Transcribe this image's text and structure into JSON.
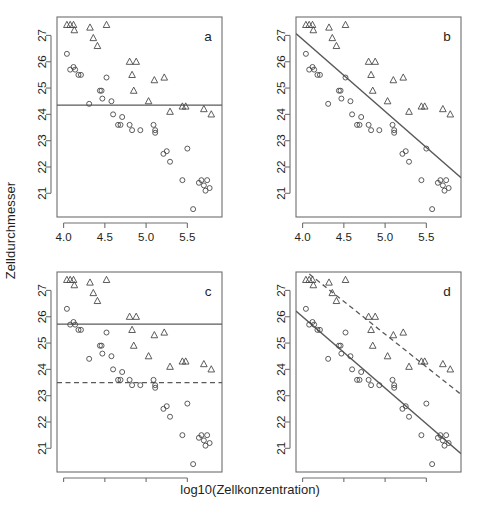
{
  "figure": {
    "xlabel": "log10(Zellkonzentration)",
    "ylabel": "Zelldurchmesser",
    "panel_labels": [
      "a",
      "b",
      "c",
      "d"
    ],
    "colors": {
      "axis": "#6e6e6e",
      "point": "#4a4a4a",
      "line": "#5a5a5a",
      "text": "#231f20",
      "background": "#ffffff"
    }
  },
  "chart_data": [
    {
      "type": "scatter",
      "panel": "a",
      "title": "a",
      "xlabel": "log10(Zellkonzentration)",
      "ylabel": "Zelldurchmesser",
      "xlim": [
        3.92,
        5.92
      ],
      "ylim": [
        20.1,
        27.7
      ],
      "xticks": [
        4.0,
        4.5,
        5.0,
        5.5
      ],
      "yticks": [
        21,
        22,
        23,
        24,
        25,
        26,
        27
      ],
      "grid": false,
      "legend": "none",
      "series": [
        {
          "name": "circles",
          "marker": "circle",
          "x": [
            4.04,
            4.08,
            4.12,
            4.14,
            4.18,
            4.21,
            4.31,
            4.44,
            4.46,
            4.47,
            4.52,
            4.58,
            4.6,
            4.66,
            4.69,
            4.71,
            4.8,
            4.83,
            4.93,
            5.09,
            5.11,
            5.11,
            5.21,
            5.25,
            5.29,
            5.44,
            5.5,
            5.57,
            5.64,
            5.67,
            5.7,
            5.72,
            5.74,
            5.77
          ],
          "y": [
            26.3,
            25.7,
            25.8,
            25.7,
            25.5,
            25.5,
            24.4,
            24.9,
            24.9,
            24.6,
            25.4,
            24.5,
            24.0,
            23.6,
            23.6,
            23.9,
            23.6,
            23.4,
            23.4,
            23.6,
            23.4,
            23.3,
            22.5,
            22.6,
            22.2,
            21.5,
            22.7,
            20.4,
            21.4,
            21.5,
            21.3,
            21.1,
            21.5,
            21.2
          ]
        },
        {
          "name": "triangles",
          "marker": "triangle",
          "x": [
            4.04,
            4.08,
            4.12,
            4.13,
            4.32,
            4.36,
            4.41,
            4.52,
            4.8,
            4.83,
            4.88,
            4.85,
            5.03,
            5.1,
            5.22,
            5.29,
            5.44,
            5.48,
            5.7,
            5.79
          ],
          "y": [
            27.4,
            27.4,
            27.4,
            27.2,
            27.3,
            26.9,
            26.6,
            27.4,
            26.0,
            25.5,
            26.0,
            24.9,
            24.5,
            25.3,
            25.4,
            24.1,
            24.3,
            24.3,
            24.2,
            24.0
          ]
        }
      ],
      "fitted_lines": [
        {
          "name": "common-mean",
          "style": "solid",
          "type": "horizontal",
          "intercept": 24.35,
          "slope": 0.0
        }
      ]
    },
    {
      "type": "scatter",
      "panel": "b",
      "title": "b",
      "xlabel": "log10(Zellkonzentration)",
      "ylabel": "Zelldurchmesser",
      "xlim": [
        3.92,
        5.92
      ],
      "ylim": [
        20.1,
        27.7
      ],
      "xticks": [
        4.0,
        4.5,
        5.0,
        5.5
      ],
      "yticks": [
        21,
        22,
        23,
        24,
        25,
        26,
        27
      ],
      "grid": false,
      "legend": "none",
      "series": [
        {
          "name": "circles",
          "marker": "circle",
          "x": [
            4.04,
            4.08,
            4.12,
            4.14,
            4.18,
            4.21,
            4.31,
            4.44,
            4.46,
            4.47,
            4.52,
            4.58,
            4.6,
            4.66,
            4.69,
            4.71,
            4.8,
            4.83,
            4.93,
            5.09,
            5.11,
            5.11,
            5.21,
            5.25,
            5.29,
            5.44,
            5.5,
            5.57,
            5.64,
            5.67,
            5.7,
            5.72,
            5.74,
            5.77
          ],
          "y": [
            26.3,
            25.7,
            25.8,
            25.7,
            25.5,
            25.5,
            24.4,
            24.9,
            24.9,
            24.6,
            25.4,
            24.5,
            24.0,
            23.6,
            23.6,
            23.9,
            23.6,
            23.4,
            23.4,
            23.6,
            23.4,
            23.3,
            22.5,
            22.6,
            22.2,
            21.5,
            22.7,
            20.4,
            21.4,
            21.5,
            21.3,
            21.1,
            21.5,
            21.2
          ]
        },
        {
          "name": "triangles",
          "marker": "triangle",
          "x": [
            4.04,
            4.08,
            4.12,
            4.13,
            4.32,
            4.36,
            4.41,
            4.52,
            4.8,
            4.83,
            4.88,
            4.85,
            5.03,
            5.1,
            5.22,
            5.29,
            5.44,
            5.48,
            5.7,
            5.79
          ],
          "y": [
            27.4,
            27.4,
            27.4,
            27.2,
            27.3,
            26.9,
            26.6,
            27.4,
            26.0,
            25.5,
            26.0,
            24.9,
            24.5,
            25.3,
            25.4,
            24.1,
            24.3,
            24.3,
            24.2,
            24.0
          ]
        }
      ],
      "fitted_lines": [
        {
          "name": "common-slope",
          "style": "solid",
          "type": "regression",
          "x_start": 4.0,
          "y_start": 26.85,
          "x_end": 5.9,
          "y_end": 21.65
        }
      ]
    },
    {
      "type": "scatter",
      "panel": "c",
      "title": "c",
      "xlabel": "log10(Zellkonzentration)",
      "ylabel": "Zelldurchmesser",
      "xlim": [
        3.92,
        5.92
      ],
      "ylim": [
        20.1,
        27.7
      ],
      "xticks": [
        4.0,
        4.5,
        5.0,
        5.5
      ],
      "yticks": [
        21,
        22,
        23,
        24,
        25,
        26,
        27
      ],
      "grid": false,
      "legend": "none",
      "series": [
        {
          "name": "circles",
          "marker": "circle",
          "x": [
            4.04,
            4.08,
            4.12,
            4.14,
            4.18,
            4.21,
            4.31,
            4.44,
            4.46,
            4.47,
            4.52,
            4.58,
            4.6,
            4.66,
            4.69,
            4.71,
            4.8,
            4.83,
            4.93,
            5.09,
            5.11,
            5.11,
            5.21,
            5.25,
            5.29,
            5.44,
            5.5,
            5.57,
            5.64,
            5.67,
            5.7,
            5.72,
            5.74,
            5.77
          ],
          "y": [
            26.3,
            25.7,
            25.8,
            25.7,
            25.5,
            25.5,
            24.4,
            24.9,
            24.9,
            24.6,
            25.4,
            24.5,
            24.0,
            23.6,
            23.6,
            23.9,
            23.6,
            23.4,
            23.4,
            23.6,
            23.4,
            23.3,
            22.5,
            22.6,
            22.2,
            21.5,
            22.7,
            20.4,
            21.4,
            21.5,
            21.3,
            21.1,
            21.5,
            21.2
          ]
        },
        {
          "name": "triangles",
          "marker": "triangle",
          "x": [
            4.04,
            4.08,
            4.12,
            4.13,
            4.32,
            4.36,
            4.41,
            4.52,
            4.8,
            4.83,
            4.88,
            4.85,
            5.03,
            5.1,
            5.22,
            5.29,
            5.44,
            5.48,
            5.7,
            5.79
          ],
          "y": [
            27.4,
            27.4,
            27.4,
            27.2,
            27.3,
            26.9,
            26.6,
            27.4,
            26.0,
            25.5,
            26.0,
            24.9,
            24.5,
            25.3,
            25.4,
            24.1,
            24.3,
            24.3,
            24.2,
            24.0
          ]
        }
      ],
      "fitted_lines": [
        {
          "name": "triangle-mean",
          "style": "solid",
          "type": "horizontal",
          "intercept": 25.72,
          "slope": 0.0
        },
        {
          "name": "circle-mean",
          "style": "dashed",
          "type": "horizontal",
          "intercept": 23.5,
          "slope": 0.0
        }
      ]
    },
    {
      "type": "scatter",
      "panel": "d",
      "title": "d",
      "xlabel": "log10(Zellkonzentration)",
      "ylabel": "Zelldurchmesser",
      "xlim": [
        3.92,
        5.92
      ],
      "ylim": [
        20.1,
        27.7
      ],
      "xticks": [
        4.0,
        4.5,
        5.0,
        5.5
      ],
      "yticks": [
        21,
        22,
        23,
        24,
        25,
        26,
        27
      ],
      "grid": false,
      "legend": "none",
      "series": [
        {
          "name": "circles",
          "marker": "circle",
          "x": [
            4.04,
            4.08,
            4.12,
            4.14,
            4.18,
            4.21,
            4.31,
            4.44,
            4.46,
            4.47,
            4.52,
            4.58,
            4.6,
            4.66,
            4.69,
            4.71,
            4.8,
            4.83,
            4.93,
            5.09,
            5.11,
            5.11,
            5.21,
            5.25,
            5.29,
            5.44,
            5.5,
            5.57,
            5.64,
            5.67,
            5.7,
            5.72,
            5.74,
            5.77
          ],
          "y": [
            26.3,
            25.7,
            25.8,
            25.7,
            25.5,
            25.5,
            24.4,
            24.9,
            24.9,
            24.6,
            25.4,
            24.5,
            24.0,
            23.6,
            23.6,
            23.9,
            23.6,
            23.4,
            23.4,
            23.6,
            23.4,
            23.3,
            22.5,
            22.6,
            22.2,
            21.5,
            22.7,
            20.4,
            21.4,
            21.5,
            21.3,
            21.1,
            21.5,
            21.2
          ]
        },
        {
          "name": "triangles",
          "marker": "triangle",
          "x": [
            4.04,
            4.08,
            4.12,
            4.13,
            4.32,
            4.36,
            4.41,
            4.52,
            4.8,
            4.83,
            4.88,
            4.85,
            5.03,
            5.1,
            5.22,
            5.29,
            5.44,
            5.48,
            5.7,
            5.79
          ],
          "y": [
            27.4,
            27.4,
            27.4,
            27.2,
            27.3,
            26.9,
            26.6,
            27.4,
            26.0,
            25.5,
            26.0,
            24.9,
            24.5,
            25.3,
            25.4,
            24.1,
            24.3,
            24.3,
            24.2,
            24.0
          ]
        }
      ],
      "fitted_lines": [
        {
          "name": "circle-regression",
          "style": "solid",
          "type": "regression",
          "x_start": 4.0,
          "y_start": 26.0,
          "x_end": 5.9,
          "y_end": 20.85
        },
        {
          "name": "triangle-regression",
          "style": "dashed",
          "type": "regression",
          "x_start": 4.05,
          "y_start": 27.7,
          "x_end": 5.9,
          "y_end": 23.1
        }
      ]
    }
  ]
}
